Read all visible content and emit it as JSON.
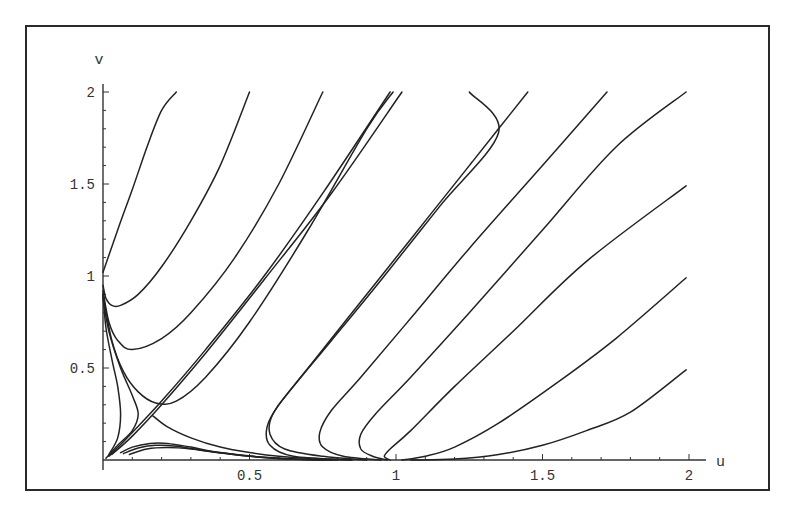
{
  "chart_data": {
    "type": "line",
    "title": "",
    "xlabel": "u",
    "ylabel": "v",
    "xlim": [
      0,
      2
    ],
    "ylim": [
      0,
      2
    ],
    "grid": false,
    "legend": null,
    "x_ticks": [
      {
        "value": 0.5,
        "label": "0.5"
      },
      {
        "value": 1,
        "label": "1"
      },
      {
        "value": 1.5,
        "label": "1.5"
      },
      {
        "value": 2,
        "label": "2"
      }
    ],
    "y_ticks": [
      {
        "value": 0.5,
        "label": "0.5"
      },
      {
        "value": 1,
        "label": "1"
      },
      {
        "value": 1.5,
        "label": "1.5"
      },
      {
        "value": 2,
        "label": "2"
      }
    ],
    "series": [
      {
        "name": "traj-1",
        "points": [
          [
            0,
            1.02
          ],
          [
            0.05,
            1.25
          ],
          [
            0.1,
            1.47
          ],
          [
            0.15,
            1.7
          ],
          [
            0.2,
            1.9
          ],
          [
            0.25,
            2.0
          ]
        ]
      },
      {
        "name": "traj-2",
        "points": [
          [
            0,
            0.95
          ],
          [
            0.01,
            0.88
          ],
          [
            0.03,
            0.84
          ],
          [
            0.06,
            0.84
          ],
          [
            0.12,
            0.9
          ],
          [
            0.2,
            1.05
          ],
          [
            0.3,
            1.3
          ],
          [
            0.4,
            1.6
          ],
          [
            0.5,
            2.0
          ]
        ]
      },
      {
        "name": "traj-3",
        "points": [
          [
            0,
            0.92
          ],
          [
            0.02,
            0.75
          ],
          [
            0.05,
            0.65
          ],
          [
            0.1,
            0.6
          ],
          [
            0.2,
            0.66
          ],
          [
            0.3,
            0.8
          ],
          [
            0.45,
            1.1
          ],
          [
            0.6,
            1.5
          ],
          [
            0.75,
            2.0
          ]
        ]
      },
      {
        "name": "traj-4",
        "points": [
          [
            0,
            0.9
          ],
          [
            0.03,
            0.65
          ],
          [
            0.07,
            0.48
          ],
          [
            0.12,
            0.37
          ],
          [
            0.18,
            0.31
          ],
          [
            0.25,
            0.32
          ],
          [
            0.35,
            0.45
          ],
          [
            0.5,
            0.75
          ],
          [
            0.7,
            1.25
          ],
          [
            0.9,
            1.8
          ],
          [
            0.99,
            2.0
          ]
        ]
      },
      {
        "name": "separatrix-a",
        "points": [
          [
            0.02,
            0.02
          ],
          [
            0.1,
            0.15
          ],
          [
            0.2,
            0.32
          ],
          [
            0.35,
            0.6
          ],
          [
            0.55,
            1.0
          ],
          [
            0.75,
            1.45
          ],
          [
            0.98,
            2.0
          ]
        ]
      },
      {
        "name": "separatrix-b",
        "points": [
          [
            0.03,
            0.03
          ],
          [
            0.1,
            0.13
          ],
          [
            0.2,
            0.3
          ],
          [
            0.35,
            0.58
          ],
          [
            0.55,
            0.98
          ],
          [
            0.78,
            1.45
          ],
          [
            1.02,
            2.0
          ]
        ]
      },
      {
        "name": "traj-left-1",
        "points": [
          [
            0.02,
            0.03
          ],
          [
            0.05,
            0.12
          ],
          [
            0.06,
            0.25
          ],
          [
            0.05,
            0.4
          ],
          [
            0.03,
            0.55
          ],
          [
            0.01,
            0.72
          ],
          [
            0,
            0.9
          ]
        ]
      },
      {
        "name": "traj-left-2",
        "points": [
          [
            0.01,
            0.01
          ],
          [
            0.05,
            0.08
          ],
          [
            0.1,
            0.16
          ],
          [
            0.12,
            0.25
          ],
          [
            0.1,
            0.35
          ],
          [
            0.06,
            0.5
          ],
          [
            0.02,
            0.7
          ],
          [
            0,
            0.88
          ]
        ]
      },
      {
        "name": "cusp-branch",
        "points": [
          [
            0.17,
            0.24
          ],
          [
            0.22,
            0.18
          ],
          [
            0.3,
            0.12
          ],
          [
            0.4,
            0.07
          ],
          [
            0.5,
            0.04
          ],
          [
            0.6,
            0.02
          ],
          [
            0.75,
            0.005
          ],
          [
            0.85,
            0.0
          ]
        ]
      },
      {
        "name": "low-1",
        "points": [
          [
            0.06,
            0.04
          ],
          [
            0.1,
            0.07
          ],
          [
            0.16,
            0.09
          ],
          [
            0.22,
            0.09
          ],
          [
            0.3,
            0.07
          ],
          [
            0.4,
            0.04
          ],
          [
            0.55,
            0.015
          ],
          [
            0.7,
            0.003
          ],
          [
            0.8,
            0.0
          ]
        ]
      },
      {
        "name": "low-2",
        "points": [
          [
            0.07,
            0.035
          ],
          [
            0.12,
            0.065
          ],
          [
            0.18,
            0.08
          ],
          [
            0.25,
            0.075
          ],
          [
            0.35,
            0.05
          ],
          [
            0.5,
            0.02
          ],
          [
            0.65,
            0.005
          ],
          [
            0.78,
            0.0
          ]
        ]
      },
      {
        "name": "low-3",
        "points": [
          [
            0.09,
            0.03
          ],
          [
            0.15,
            0.06
          ],
          [
            0.22,
            0.068
          ],
          [
            0.3,
            0.06
          ],
          [
            0.42,
            0.035
          ],
          [
            0.58,
            0.01
          ],
          [
            0.75,
            0.0
          ]
        ]
      },
      {
        "name": "traj-5",
        "points": [
          [
            0.85,
            0.0
          ],
          [
            0.65,
            0.02
          ],
          [
            0.57,
            0.08
          ],
          [
            0.56,
            0.18
          ],
          [
            0.6,
            0.3
          ],
          [
            0.7,
            0.5
          ],
          [
            0.85,
            0.8
          ],
          [
            1.05,
            1.2
          ],
          [
            1.25,
            1.6
          ],
          [
            1.25,
            1.6
          ],
          [
            1.45,
            2.0
          ]
        ]
      },
      {
        "name": "traj-5b",
        "points": [
          [
            0.9,
            0.0
          ],
          [
            0.75,
            0.02
          ],
          [
            0.62,
            0.06
          ],
          [
            0.57,
            0.14
          ],
          [
            0.58,
            0.25
          ],
          [
            0.65,
            0.4
          ],
          [
            0.78,
            0.65
          ],
          [
            0.95,
            0.98
          ],
          [
            1.15,
            1.38
          ],
          [
            1.35,
            1.78
          ],
          [
            1.25,
            2.0
          ]
        ]
      },
      {
        "name": "traj-6",
        "points": [
          [
            0.95,
            0.0
          ],
          [
            0.82,
            0.02
          ],
          [
            0.75,
            0.07
          ],
          [
            0.74,
            0.15
          ],
          [
            0.78,
            0.27
          ],
          [
            0.88,
            0.45
          ],
          [
            1.05,
            0.77
          ],
          [
            1.25,
            1.15
          ],
          [
            1.5,
            1.6
          ],
          [
            1.72,
            2.0
          ]
        ]
      },
      {
        "name": "traj-7",
        "points": [
          [
            0.97,
            0.0
          ],
          [
            0.92,
            0.02
          ],
          [
            0.88,
            0.06
          ],
          [
            0.88,
            0.14
          ],
          [
            0.93,
            0.25
          ],
          [
            1.05,
            0.45
          ],
          [
            1.25,
            0.8
          ],
          [
            1.5,
            1.25
          ],
          [
            1.75,
            1.7
          ],
          [
            1.99,
            2.0
          ]
        ]
      },
      {
        "name": "traj-8",
        "points": [
          [
            0.98,
            0.0
          ],
          [
            0.96,
            0.02
          ],
          [
            0.98,
            0.06
          ],
          [
            1.05,
            0.16
          ],
          [
            1.2,
            0.4
          ],
          [
            1.4,
            0.7
          ],
          [
            1.65,
            1.08
          ],
          [
            1.99,
            1.49
          ]
        ]
      },
      {
        "name": "traj-9",
        "points": [
          [
            1.02,
            0.0
          ],
          [
            1.1,
            0.02
          ],
          [
            1.2,
            0.07
          ],
          [
            1.35,
            0.2
          ],
          [
            1.55,
            0.42
          ],
          [
            1.75,
            0.66
          ],
          [
            1.99,
            0.99
          ]
        ]
      },
      {
        "name": "traj-10",
        "points": [
          [
            1.05,
            0.0
          ],
          [
            1.2,
            0.005
          ],
          [
            1.35,
            0.03
          ],
          [
            1.5,
            0.08
          ],
          [
            1.65,
            0.16
          ],
          [
            1.8,
            0.26
          ],
          [
            1.99,
            0.49
          ]
        ]
      }
    ]
  }
}
